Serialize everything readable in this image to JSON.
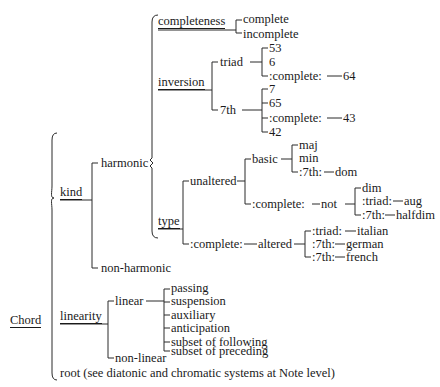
{
  "root": "Chord",
  "kind": {
    "label": "kind",
    "harmonic": {
      "label": "harmonic",
      "completeness": {
        "label": "completeness",
        "children": [
          "complete",
          "incomplete"
        ]
      },
      "inversion": {
        "label": "inversion",
        "triad": {
          "label": "triad",
          "children": [
            "53",
            "6",
            ":complete:",
            "64"
          ]
        },
        "seventh": {
          "label": "7th",
          "children": [
            "7",
            "65",
            ":complete:",
            "43",
            "42"
          ]
        }
      },
      "type": {
        "label": "type",
        "unaltered": {
          "label": "unaltered",
          "basic": {
            "label": "basic",
            "children": [
              "maj",
              "min",
              ":7th:",
              "dom"
            ]
          },
          "complete_not": {
            "prefix": ":complete:",
            "label": "not",
            "children": [
              "dim",
              ":triad:",
              "aug",
              ":7th:",
              "halfdim"
            ]
          }
        },
        "altered": {
          "prefix": ":complete:",
          "label": "altered",
          "children": [
            ":triad:",
            "italian",
            ":7th:",
            "german",
            ":7th:",
            "french"
          ]
        }
      }
    },
    "non_harmonic": "non-harmonic"
  },
  "linearity": {
    "label": "linearity",
    "linear": {
      "label": "linear",
      "children": [
        "passing",
        "suspension",
        "auxiliary",
        "anticipation",
        "subset of following",
        "subset of preceding"
      ]
    },
    "non_linear": "non-linear"
  },
  "root_note": "root (see diatonic and chromatic systems at Note level)"
}
